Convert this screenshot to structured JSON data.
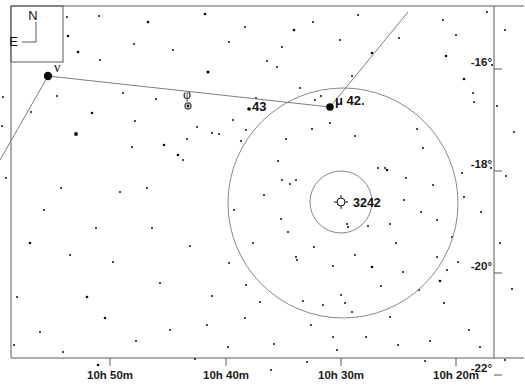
{
  "chart_data": {
    "type": "scatter",
    "title": "",
    "subtitle": "",
    "xlabel": "",
    "ylabel": "",
    "grid": false,
    "legend_position": "none",
    "projection": "equatorial",
    "x_axis": {
      "name": "Right Ascension",
      "ticks": [
        "10h 50m",
        "10h 40m",
        "10h 30m",
        "10h 20m"
      ],
      "tick_px": [
        110,
        226,
        341,
        456
      ],
      "direction": "decreasing-right"
    },
    "y_axis": {
      "name": "Declination",
      "ticks": [
        "-16°",
        "-18°",
        "-20°",
        "-22°"
      ],
      "tick_px": [
        69,
        171,
        273,
        375
      ],
      "range": [
        "-16",
        "-22"
      ]
    },
    "labeled_objects": [
      {
        "label": "ν",
        "type": "star",
        "x": 48,
        "y": 76,
        "mag_radius": 4.2
      },
      {
        "label": "φ",
        "type": "variable-star",
        "x": 188,
        "y": 106,
        "mag_radius": 3.0
      },
      {
        "label": "43",
        "type": "star",
        "x": 249,
        "y": 109,
        "mag_radius": 1.8
      },
      {
        "label": "μ 42",
        "type": "star",
        "x": 330,
        "y": 107,
        "mag_radius": 3.8
      },
      {
        "label": "3242",
        "type": "planetary-nebula",
        "x": 341,
        "y": 202,
        "mag_radius": 4.0
      }
    ],
    "circles": [
      {
        "name": "outer-field-circle",
        "cx": 343,
        "cy": 203,
        "r": 115
      },
      {
        "name": "inner-field-circle",
        "cx": 341,
        "cy": 202,
        "r": 31
      }
    ],
    "constellation_lines": [
      {
        "from": [
          48,
          76
        ],
        "to": [
          330,
          107
        ]
      },
      {
        "from": [
          48,
          76
        ],
        "to": [
          0,
          160
        ]
      },
      {
        "from": [
          330,
          107
        ],
        "to": [
          408,
          12
        ]
      }
    ],
    "stars": [
      [
        68,
        36,
        1.3
      ],
      [
        78,
        52,
        1.3
      ],
      [
        67,
        17,
        1.0
      ],
      [
        99,
        16,
        1.0
      ],
      [
        148,
        22,
        1.3
      ],
      [
        134,
        44,
        1.0
      ],
      [
        173,
        50,
        1.0
      ],
      [
        205,
        14,
        1.3
      ],
      [
        208,
        72,
        1.6
      ],
      [
        229,
        42,
        1.0
      ],
      [
        245,
        27,
        1.0
      ],
      [
        267,
        61,
        1.0
      ],
      [
        294,
        30,
        1.3
      ],
      [
        313,
        22,
        1.0
      ],
      [
        340,
        40,
        1.0
      ],
      [
        358,
        15,
        1.0
      ],
      [
        372,
        53,
        1.3
      ],
      [
        399,
        38,
        1.0
      ],
      [
        443,
        20,
        1.0
      ],
      [
        446,
        56,
        1.3
      ],
      [
        456,
        35,
        1.0
      ],
      [
        487,
        12,
        1.0
      ],
      [
        505,
        30,
        1.0
      ],
      [
        464,
        79,
        1.3
      ],
      [
        473,
        93,
        1.0
      ],
      [
        474,
        102,
        1.0
      ],
      [
        492,
        65,
        1.0
      ],
      [
        3,
        97,
        1.0
      ],
      [
        2,
        126,
        1.0
      ],
      [
        6,
        178,
        1.0
      ],
      [
        31,
        112,
        1.0
      ],
      [
        76,
        134,
        1.9
      ],
      [
        92,
        113,
        1.3
      ],
      [
        57,
        96,
        1.0
      ],
      [
        100,
        60,
        1.0
      ],
      [
        123,
        93,
        1.0
      ],
      [
        132,
        147,
        1.0
      ],
      [
        135,
        121,
        1.0
      ],
      [
        156,
        99,
        1.0
      ],
      [
        164,
        145,
        1.3
      ],
      [
        178,
        155,
        1.3
      ],
      [
        183,
        160,
        1.0
      ],
      [
        197,
        127,
        1.0
      ],
      [
        187,
        139,
        1.0
      ],
      [
        212,
        133,
        1.0
      ],
      [
        147,
        188,
        1.0
      ],
      [
        120,
        192,
        1.0
      ],
      [
        61,
        188,
        1.0
      ],
      [
        44,
        210,
        1.0
      ],
      [
        30,
        243,
        1.3
      ],
      [
        70,
        255,
        1.0
      ],
      [
        96,
        228,
        1.0
      ],
      [
        113,
        262,
        1.0
      ],
      [
        87,
        297,
        1.3
      ],
      [
        105,
        318,
        1.3
      ],
      [
        40,
        332,
        1.0
      ],
      [
        17,
        297,
        1.0
      ],
      [
        14,
        345,
        1.0
      ],
      [
        63,
        352,
        1.0
      ],
      [
        98,
        365,
        1.3
      ],
      [
        136,
        341,
        1.0
      ],
      [
        160,
        283,
        1.0
      ],
      [
        190,
        246,
        1.0
      ],
      [
        152,
        228,
        1.0
      ],
      [
        233,
        120,
        1.0
      ],
      [
        241,
        141,
        1.0
      ],
      [
        246,
        130,
        1.0
      ],
      [
        219,
        134,
        1.0
      ],
      [
        256,
        98,
        1.0
      ],
      [
        277,
        67,
        1.0
      ],
      [
        282,
        47,
        1.0
      ],
      [
        300,
        88,
        1.0
      ],
      [
        315,
        100,
        1.0
      ],
      [
        321,
        96,
        1.0
      ],
      [
        352,
        76,
        1.0
      ],
      [
        363,
        104,
        1.0
      ],
      [
        286,
        139,
        1.0
      ],
      [
        296,
        180,
        1.0
      ],
      [
        312,
        129,
        1.0
      ],
      [
        330,
        123,
        1.0
      ],
      [
        355,
        136,
        1.0
      ],
      [
        378,
        168,
        1.0
      ],
      [
        385,
        168,
        1.0
      ],
      [
        387,
        170,
        1.3
      ],
      [
        406,
        178,
        1.0
      ],
      [
        423,
        148,
        1.0
      ],
      [
        433,
        185,
        1.0
      ],
      [
        417,
        129,
        1.0
      ],
      [
        278,
        161,
        1.0
      ],
      [
        264,
        195,
        1.0
      ],
      [
        282,
        180,
        1.0
      ],
      [
        290,
        184,
        1.0
      ],
      [
        281,
        219,
        1.0
      ],
      [
        288,
        232,
        1.0
      ],
      [
        347,
        224,
        1.0
      ],
      [
        348,
        227,
        1.0
      ],
      [
        368,
        226,
        1.0
      ],
      [
        390,
        224,
        1.0
      ],
      [
        404,
        200,
        1.0
      ],
      [
        421,
        212,
        1.0
      ],
      [
        437,
        220,
        1.0
      ],
      [
        296,
        257,
        1.0
      ],
      [
        297,
        260,
        1.0
      ],
      [
        314,
        247,
        1.0
      ],
      [
        333,
        266,
        1.0
      ],
      [
        355,
        255,
        1.0
      ],
      [
        372,
        267,
        1.3
      ],
      [
        381,
        286,
        1.0
      ],
      [
        341,
        295,
        1.0
      ],
      [
        303,
        301,
        1.0
      ],
      [
        323,
        305,
        1.0
      ],
      [
        352,
        312,
        1.0
      ],
      [
        390,
        317,
        1.0
      ],
      [
        403,
        272,
        1.0
      ],
      [
        419,
        290,
        1.0
      ],
      [
        437,
        257,
        1.0
      ],
      [
        444,
        303,
        1.0
      ],
      [
        452,
        237,
        1.0
      ],
      [
        464,
        197,
        1.0
      ],
      [
        462,
        173,
        1.0
      ],
      [
        458,
        262,
        1.0
      ],
      [
        447,
        270,
        1.0
      ],
      [
        440,
        281,
        1.3
      ],
      [
        481,
        212,
        1.0
      ],
      [
        500,
        243,
        1.0
      ],
      [
        491,
        168,
        1.0
      ],
      [
        506,
        176,
        1.0
      ],
      [
        514,
        132,
        1.0
      ],
      [
        497,
        106,
        1.0
      ],
      [
        512,
        289,
        1.0
      ],
      [
        469,
        330,
        1.0
      ],
      [
        480,
        347,
        1.0
      ],
      [
        430,
        341,
        1.0
      ],
      [
        398,
        345,
        1.0
      ],
      [
        366,
        337,
        1.0
      ],
      [
        337,
        350,
        1.0
      ],
      [
        311,
        325,
        1.0
      ],
      [
        274,
        344,
        1.0
      ],
      [
        245,
        318,
        1.0
      ],
      [
        228,
        347,
        1.0
      ],
      [
        207,
        325,
        1.0
      ],
      [
        195,
        359,
        1.0
      ],
      [
        170,
        330,
        1.0
      ],
      [
        246,
        285,
        1.0
      ],
      [
        229,
        263,
        1.0
      ],
      [
        212,
        296,
        1.0
      ],
      [
        253,
        243,
        1.0
      ],
      [
        234,
        210,
        1.0
      ],
      [
        260,
        302,
        1.0
      ],
      [
        333,
        337,
        1.0
      ],
      [
        307,
        362,
        1.0
      ],
      [
        271,
        370,
        1.0
      ],
      [
        425,
        361,
        1.0
      ],
      [
        505,
        360,
        1.0
      ],
      [
        345,
        303,
        1.0
      ],
      [
        396,
        243,
        1.0
      ]
    ]
  },
  "compass": {
    "north_label": "N",
    "east_label": "E",
    "box": {
      "x": 11,
      "y": 6,
      "w": 52,
      "h": 56
    }
  },
  "frame": {
    "left": 11,
    "top": 6,
    "right": 494,
    "bottom": 358
  }
}
